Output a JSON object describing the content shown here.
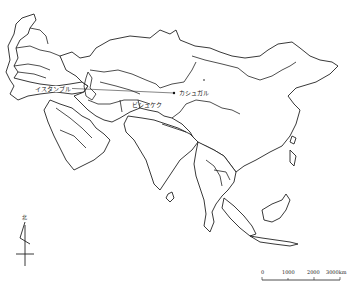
{
  "map": {
    "region": "Asia",
    "cities": [
      {
        "name": "イスタンブル",
        "x": 36,
        "y": 88
      },
      {
        "name": "ビシュケク",
        "x": 132,
        "y": 102
      },
      {
        "name": "カシュガル",
        "x": 178,
        "y": 92
      }
    ],
    "route": {
      "from": "イスタンブル",
      "to": "カシュガル"
    },
    "north_arrow": {
      "label": "北"
    },
    "scale_bar": {
      "ticks": [
        "0",
        "1000",
        "2000",
        "3000km"
      ]
    }
  }
}
